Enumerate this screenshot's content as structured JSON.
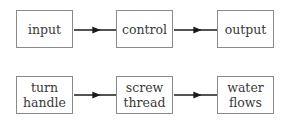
{
  "diagram": {
    "rows": [
      {
        "boxes": [
          {
            "lines": [
              "input"
            ]
          },
          {
            "lines": [
              "control"
            ]
          },
          {
            "lines": [
              "output"
            ]
          }
        ]
      },
      {
        "boxes": [
          {
            "lines": [
              "turn",
              "handle"
            ]
          },
          {
            "lines": [
              "screw",
              "thread"
            ]
          },
          {
            "lines": [
              "water",
              "flows"
            ]
          }
        ]
      }
    ],
    "colors": {
      "box_border": "#8a8a8a",
      "arrow": "#1a1a1a",
      "text": "#3a3a3a"
    }
  }
}
